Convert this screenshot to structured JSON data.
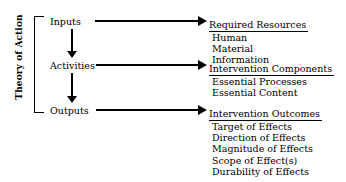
{
  "diagram": {
    "side_label": "Theory of Action",
    "stages": [
      {
        "label": "Inputs"
      },
      {
        "label": "Activities"
      },
      {
        "label": "Outputs"
      }
    ],
    "arrows": {
      "vertical_1": "down-arrow",
      "vertical_2": "down-arrow",
      "horizontal_1": "right-arrow",
      "horizontal_2": "right-arrow",
      "horizontal_3": "right-arrow"
    },
    "groups": [
      {
        "heading": "Required Resources",
        "items": [
          "Human",
          "Material",
          "Information"
        ]
      },
      {
        "heading": "Intervention Components",
        "items": [
          "Essential Processes",
          "Essential Content"
        ]
      },
      {
        "heading": "Intervention Outcomes",
        "items": [
          "Target of Effects",
          "Direction of Effects",
          "Magnitude of Effects",
          "Scope of Effect(s)",
          "Durability of Effects"
        ]
      }
    ],
    "colors": {
      "background": "#ffffff",
      "ink": "#000000"
    }
  }
}
